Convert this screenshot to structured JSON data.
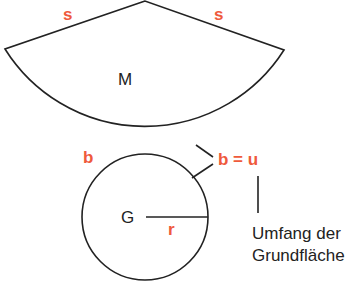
{
  "diagram": {
    "colors": {
      "accent": "#ef5a3c",
      "line": "#222222"
    },
    "labels": {
      "s_left": "s",
      "s_right": "s",
      "mantel": "M",
      "b": "b",
      "b_equals_u": "b = u",
      "grundflaeche": "G",
      "radius": "r",
      "umfang_line1": "Umfang der",
      "umfang_line2": "Grundfläche"
    },
    "shapes": [
      {
        "type": "sector",
        "name": "Mantel",
        "apex": [
          145,
          1
        ],
        "left": [
          5,
          49
        ],
        "right": [
          284,
          50
        ]
      },
      {
        "type": "circle",
        "name": "Grundfläche",
        "center": [
          145,
          217
        ],
        "radius": 63
      }
    ]
  }
}
